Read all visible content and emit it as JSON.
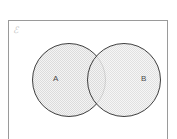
{
  "diagram": {
    "type": "venn",
    "universal_set": {
      "label": "ℰ",
      "shape": "rectangle",
      "border_color": "#9a9a9a",
      "fill_color": "#ffffff"
    },
    "sets": [
      {
        "id": "A",
        "label": "A",
        "shape": "circle",
        "center_x": 69,
        "center_y": 80,
        "radius": 37,
        "stroke_color": "#3f3f3f",
        "fill_color": "#f2f2f2",
        "label_x": 53,
        "label_y": 79
      },
      {
        "id": "B",
        "label": "B",
        "shape": "circle",
        "center_x": 124,
        "center_y": 80,
        "radius": 37,
        "stroke_color": "#3f3f3f",
        "fill_color": "#f2f2f2",
        "label_x": 141,
        "label_y": 79
      }
    ],
    "intersection": {
      "label": "",
      "shaded": true,
      "fill_pattern": "fine-dot-hatch",
      "pattern_color": "#d8d8d8"
    },
    "colors": {
      "background": "#ffffff",
      "frame_stroke": "#9a9a9a",
      "circle_stroke": "#3f3f3f",
      "circle_fill": "#f2f2f2",
      "pattern": "#d9d9d9",
      "label_text": "#4a4a4a",
      "universal_label_text": "#c4c4c4"
    }
  }
}
